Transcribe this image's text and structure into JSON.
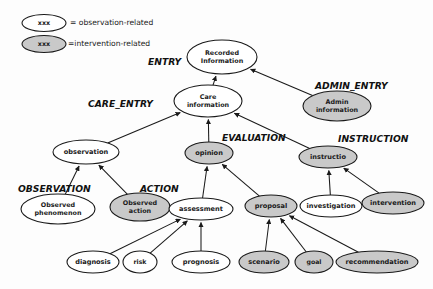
{
  "diagram": {
    "colors": {
      "observation_fill": "#ffffff",
      "intervention_fill": "#c9c9c9",
      "stroke": "#1a1a1a",
      "background": "#fdfdfd"
    },
    "legend": {
      "items": [
        {
          "sample_text": "xxx",
          "label": "= observation-related",
          "kind": "observation"
        },
        {
          "sample_text": "xxx",
          "label": "=intervention-related",
          "kind": "intervention"
        }
      ]
    },
    "group_labels": [
      {
        "id": "entry",
        "text": "ENTRY",
        "x": 148,
        "y": 62
      },
      {
        "id": "care_entry",
        "text": "CARE_ENTRY",
        "x": 88,
        "y": 104
      },
      {
        "id": "admin_entry",
        "text": "ADMIN_ENTRY",
        "x": 315,
        "y": 86
      },
      {
        "id": "evaluation",
        "text": "EVALUATION",
        "x": 222,
        "y": 138
      },
      {
        "id": "instruction",
        "text": "INSTRUCTION",
        "x": 338,
        "y": 139
      },
      {
        "id": "observation",
        "text": "OBSERVATION",
        "x": 18,
        "y": 189
      },
      {
        "id": "action",
        "text": "ACTION",
        "x": 140,
        "y": 189
      }
    ],
    "nodes": [
      {
        "id": "recorded_information",
        "label": "Recorded Information",
        "lines": [
          "Recorded",
          "Information"
        ],
        "kind": "observation",
        "cx": 222,
        "cy": 57,
        "rx": 35,
        "ry": 17
      },
      {
        "id": "care_information",
        "label": "Care information",
        "lines": [
          "Care",
          "information"
        ],
        "kind": "observation",
        "cx": 208,
        "cy": 101,
        "rx": 34,
        "ry": 16
      },
      {
        "id": "admin_information",
        "label": "Admin information",
        "lines": [
          "Admin",
          "information"
        ],
        "kind": "intervention",
        "cx": 337,
        "cy": 106,
        "rx": 34,
        "ry": 15
      },
      {
        "id": "observation",
        "label": "observation",
        "lines": [
          "observation"
        ],
        "kind": "observation",
        "cx": 86,
        "cy": 152,
        "rx": 33,
        "ry": 12
      },
      {
        "id": "opinion",
        "label": "opinion",
        "lines": [
          "opinion"
        ],
        "kind": "intervention",
        "cx": 209,
        "cy": 153,
        "rx": 24,
        "ry": 11
      },
      {
        "id": "instructio",
        "label": "instructio",
        "lines": [
          "instructio"
        ],
        "kind": "intervention",
        "cx": 328,
        "cy": 157,
        "rx": 29,
        "ry": 11
      },
      {
        "id": "observed_phenomenon",
        "label": "Observed phenomenon",
        "lines": [
          "Observed",
          "phenomenon"
        ],
        "kind": "observation",
        "cx": 58,
        "cy": 209,
        "rx": 37,
        "ry": 15
      },
      {
        "id": "observed_action",
        "label": "Observed action",
        "lines": [
          "Observed",
          "action"
        ],
        "kind": "intervention",
        "cx": 140,
        "cy": 207,
        "rx": 30,
        "ry": 14
      },
      {
        "id": "assessment",
        "label": "assessment",
        "lines": [
          "assessment"
        ],
        "kind": "observation",
        "cx": 201,
        "cy": 209,
        "rx": 32,
        "ry": 11
      },
      {
        "id": "proposal",
        "label": "proposal",
        "lines": [
          "proposal"
        ],
        "kind": "intervention",
        "cx": 271,
        "cy": 206,
        "rx": 26,
        "ry": 11
      },
      {
        "id": "investigation",
        "label": "investigation",
        "lines": [
          "investigation"
        ],
        "kind": "observation",
        "cx": 331,
        "cy": 206,
        "rx": 31,
        "ry": 11
      },
      {
        "id": "intervention",
        "label": "intervention",
        "lines": [
          "intervention"
        ],
        "kind": "intervention",
        "cx": 393,
        "cy": 203,
        "rx": 31,
        "ry": 11
      },
      {
        "id": "diagnosis",
        "label": "diagnosis",
        "lines": [
          "diagnosis"
        ],
        "kind": "observation",
        "cx": 93,
        "cy": 262,
        "rx": 26,
        "ry": 11
      },
      {
        "id": "risk",
        "label": "risk",
        "lines": [
          "risk"
        ],
        "kind": "observation",
        "cx": 140,
        "cy": 262,
        "rx": 17,
        "ry": 11
      },
      {
        "id": "prognosis",
        "label": "prognosis",
        "lines": [
          "prognosis"
        ],
        "kind": "observation",
        "cx": 201,
        "cy": 262,
        "rx": 29,
        "ry": 11
      },
      {
        "id": "scenario",
        "label": "scenario",
        "lines": [
          "scenario"
        ],
        "kind": "intervention",
        "cx": 264,
        "cy": 262,
        "rx": 25,
        "ry": 11
      },
      {
        "id": "goal",
        "label": "goal",
        "lines": [
          "goal"
        ],
        "kind": "intervention",
        "cx": 314,
        "cy": 262,
        "rx": 19,
        "ry": 11
      },
      {
        "id": "recommendation",
        "label": "recommendation",
        "lines": [
          "recommendation"
        ],
        "kind": "intervention",
        "cx": 377,
        "cy": 262,
        "rx": 41,
        "ry": 11
      }
    ],
    "edges": [
      {
        "from": "care_information",
        "to": "recorded_information"
      },
      {
        "from": "admin_information",
        "to": "recorded_information"
      },
      {
        "from": "observation",
        "to": "care_information"
      },
      {
        "from": "opinion",
        "to": "care_information"
      },
      {
        "from": "instructio",
        "to": "care_information"
      },
      {
        "from": "observed_phenomenon",
        "to": "observation"
      },
      {
        "from": "observed_action",
        "to": "observation"
      },
      {
        "from": "assessment",
        "to": "opinion"
      },
      {
        "from": "proposal",
        "to": "opinion"
      },
      {
        "from": "investigation",
        "to": "instructio"
      },
      {
        "from": "intervention",
        "to": "instructio"
      },
      {
        "from": "diagnosis",
        "to": "assessment"
      },
      {
        "from": "risk",
        "to": "assessment"
      },
      {
        "from": "prognosis",
        "to": "assessment"
      },
      {
        "from": "scenario",
        "to": "proposal"
      },
      {
        "from": "goal",
        "to": "proposal"
      },
      {
        "from": "recommendation",
        "to": "proposal"
      }
    ]
  }
}
